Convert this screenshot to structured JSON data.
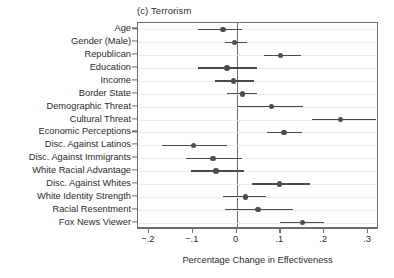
{
  "chart_data": {
    "type": "scatter",
    "title": "(c) Terrorism",
    "subtitle": "",
    "xlabel": "Percentage Change in Effectiveness",
    "ylabel": "",
    "xlim": [
      -0.225,
      0.325
    ],
    "xticks": [
      -0.2,
      -0.1,
      0,
      0.1,
      0.2,
      0.3
    ],
    "xticklabels": [
      "−.2",
      "−.1",
      "0",
      ".1",
      ".2",
      ".3"
    ],
    "grid": true,
    "grid_orientation": "horizontal",
    "legend": "none",
    "reference_line": 0,
    "orientation": "horizontal",
    "marker": "filled-circle",
    "error_bars": "95% confidence interval",
    "categories": [
      "Age",
      "Gender (Male)",
      "Republican",
      "Education",
      "Income",
      "Border State",
      "Demographic Threat",
      "Cultural Threat",
      "Economic Perceptions",
      "Disc. Against Latinos",
      "Disc. Against Immigrants",
      "White Racial Advantage",
      "Disc. Against Whites",
      "White Identity Strength",
      "Racial Resentment",
      "Fox News Viewer"
    ],
    "values": [
      -0.031,
      -0.005,
      0.1,
      -0.022,
      -0.007,
      0.013,
      0.08,
      0.237,
      0.108,
      -0.098,
      -0.054,
      -0.047,
      0.098,
      0.02,
      0.049,
      0.151
    ],
    "ci_low": [
      -0.087,
      -0.027,
      0.062,
      -0.087,
      -0.049,
      -0.022,
      0.0,
      0.173,
      0.069,
      -0.171,
      -0.115,
      -0.104,
      0.036,
      -0.031,
      -0.027,
      0.098
    ],
    "ci_high": [
      0.013,
      0.024,
      0.147,
      0.047,
      0.04,
      0.047,
      0.151,
      0.318,
      0.149,
      -0.022,
      0.013,
      0.018,
      0.167,
      0.067,
      0.129,
      0.2
    ],
    "colors": {
      "marker": "#4d4d4d",
      "error_bar": "#4a4a4a",
      "frame": "#6d6d6d",
      "gridline": "#ececec",
      "text": "#2b2b2b",
      "background": "#ffffff"
    }
  }
}
